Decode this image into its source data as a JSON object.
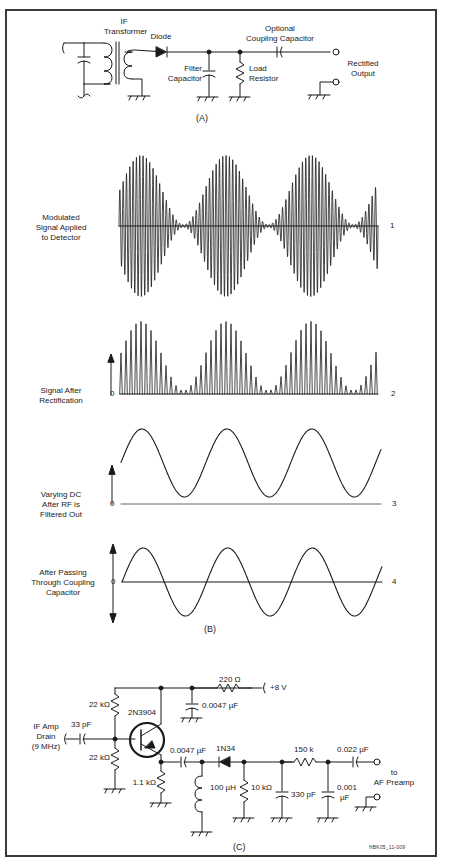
{
  "figure": {
    "credit": "HBK05_11-009",
    "panels": {
      "a": "(A)",
      "b": "(B)",
      "c": "(C)"
    }
  },
  "panel_a": {
    "if_transformer": [
      "IF",
      "Transformer"
    ],
    "diode": "Diode",
    "filter_capacitor": [
      "Filter",
      "Capacitor"
    ],
    "load_resistor": [
      "Load",
      "Resistor"
    ],
    "coupling_capacitor": [
      "Optional",
      "Coupling Capacitor"
    ],
    "output": [
      "Rectified",
      "Output"
    ]
  },
  "panel_b": {
    "waveforms": [
      {
        "label": [
          "Modulated",
          "Signal Applied",
          "to Detector"
        ],
        "number": "1",
        "zero": ""
      },
      {
        "label": [
          "Signal After",
          "Rectification"
        ],
        "number": "2",
        "zero": "0"
      },
      {
        "label": [
          "Varying DC",
          "After RF is",
          "Filtered Out"
        ],
        "number": "3",
        "zero": "0"
      },
      {
        "label": [
          "After Passing",
          "Through Coupling",
          "Capacitor"
        ],
        "number": "4",
        "zero": "0"
      }
    ]
  },
  "panel_c": {
    "input": [
      "IF Amp",
      "Drain",
      "(9 MHz)"
    ],
    "c_in": "33 pF",
    "r_bias_top": "22 kΩ",
    "r_bias_bottom": "22 kΩ",
    "transistor": "2N3904",
    "r_emitter": "1.1 kΩ",
    "r_supply": "220 Ω",
    "supply": "+8 V",
    "c_bypass": "0.0047 µF",
    "c_couple": "0.0047 µF",
    "inductor": "100 µH",
    "diode": "1N34",
    "r_load": "10 kΩ",
    "c_filter1": "330 pF",
    "r_filter": "150 k",
    "c_filter2": [
      "0.001",
      "µF"
    ],
    "c_out": "0.022 µF",
    "output": [
      "to",
      "AF Preamp"
    ]
  }
}
